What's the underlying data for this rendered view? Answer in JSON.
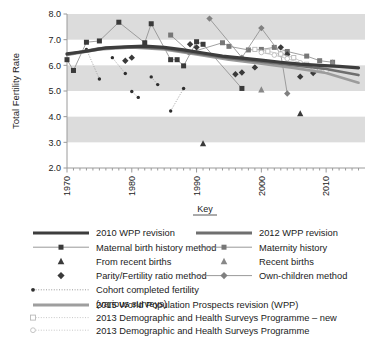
{
  "chart_data": {
    "type": "scatter",
    "title": "",
    "xlabel": "",
    "ylabel": "Total Fertility Rate",
    "xlim": [
      1970,
      2016
    ],
    "ylim": [
      2.0,
      8.0
    ],
    "xticks": [
      1970,
      1980,
      1990,
      2000,
      2010
    ],
    "xtick_labels": [
      "1970",
      "1980",
      "1990",
      "2000",
      "2010"
    ],
    "yticks": [
      2.0,
      3.0,
      4.0,
      5.0,
      6.0,
      7.0,
      8.0
    ],
    "ytick_labels": [
      "2.0",
      "3.0",
      "4.0",
      "5.0",
      "6.0",
      "7.0",
      "8.0"
    ],
    "grid": false,
    "banding": "alternating horizontal grey bands at 3.0-4.0, 5.0-6.0, 7.0-8.0",
    "legend_position": "below plot",
    "series": [
      {
        "name": "2010 WPP revision",
        "style": "thick-line-dark",
        "x": [
          1970,
          1973,
          1976,
          1979,
          1982,
          1985,
          1988,
          1991,
          1994,
          1997,
          2000,
          2003,
          2006,
          2009,
          2012,
          2015
        ],
        "values": [
          6.45,
          6.55,
          6.68,
          6.72,
          6.75,
          6.7,
          6.6,
          6.48,
          6.36,
          6.28,
          6.2,
          6.12,
          6.05,
          6.0,
          5.96,
          5.9
        ]
      },
      {
        "name": "2012 WPP revision",
        "style": "thick-line-mid",
        "x": [
          1970,
          1975,
          1980,
          1985,
          1990,
          1995,
          2000,
          2005,
          2010,
          2015
        ],
        "values": [
          6.42,
          6.66,
          6.72,
          6.66,
          6.46,
          6.28,
          6.14,
          6.0,
          5.86,
          5.62
        ]
      },
      {
        "name": "2015 World Population Prospects revision (WPP)",
        "style": "thick-line-light",
        "x": [
          1970,
          1975,
          1980,
          1985,
          1990,
          1995,
          2000,
          2005,
          2010,
          2015
        ],
        "values": [
          6.4,
          6.62,
          6.7,
          6.62,
          6.42,
          6.22,
          6.06,
          5.9,
          5.7,
          5.32
        ]
      },
      {
        "name": "Maternal birth history method",
        "style": "thin-line-filled-square",
        "x": [
          1970,
          1971,
          1973,
          1975,
          1978,
          1982,
          1983,
          1986,
          1987,
          1988,
          1990,
          1991,
          1997
        ],
        "values": [
          6.22,
          5.8,
          6.9,
          6.95,
          7.68,
          6.88,
          7.62,
          6.22,
          6.22,
          5.98,
          6.92,
          6.82,
          5.1
        ]
      },
      {
        "name": "Maternity history",
        "style": "thin-line-mid-square",
        "x": [
          1986,
          1989,
          1994,
          1995,
          1998,
          2000,
          2002,
          2004,
          2007,
          2009,
          2011
        ],
        "values": [
          7.18,
          6.5,
          6.88,
          6.74,
          6.6,
          6.62,
          6.7,
          6.54,
          6.36,
          6.18,
          6.12
        ]
      },
      {
        "name": "From recent births",
        "style": "filled-triangle",
        "x": [
          1991,
          2006
        ],
        "values": [
          2.95,
          4.12
        ]
      },
      {
        "name": "Recent births",
        "style": "mid-triangle",
        "x": [
          2000,
          2011
        ],
        "values": [
          5.05,
          6.1
        ]
      },
      {
        "name": "Parity/Fertility ratio method",
        "style": "filled-diamond",
        "x": [
          1979,
          1980,
          1989,
          1990,
          1996,
          1997,
          1999,
          2003,
          2004,
          2006,
          2008
        ],
        "values": [
          6.18,
          6.3,
          6.82,
          6.7,
          5.65,
          5.72,
          5.92,
          6.7,
          6.42,
          5.56,
          5.7
        ]
      },
      {
        "name": "Own-children method",
        "style": "mid-diamond-line",
        "x": [
          1992,
          1997,
          2000,
          2003,
          2004
        ],
        "values": [
          7.82,
          6.3,
          7.45,
          6.44,
          4.9
        ]
      },
      {
        "name": "Cohort completed fertility (various surveys)",
        "style": "dotted-small-dot",
        "x": [
          1973,
          1975,
          1977,
          1979,
          1980,
          1981,
          1983,
          1984,
          1986,
          1988
        ],
        "values": [
          6.62,
          5.47,
          6.3,
          5.68,
          4.98,
          4.75,
          5.55,
          5.25,
          4.22,
          5.1
        ]
      },
      {
        "name": "2013 Demographic and Health Surveys Programme – new",
        "style": "open-square-dotted",
        "x": [
          1999,
          2001,
          2003,
          2005,
          2007,
          2009
        ],
        "values": [
          6.62,
          6.55,
          6.44,
          6.3,
          6.04,
          5.88
        ]
      },
      {
        "name": "2013 Demographic and Health Surveys Programme",
        "style": "open-circle-dotted",
        "x": [
          2000,
          2002,
          2004,
          2006,
          2008,
          2010
        ],
        "values": [
          6.5,
          6.4,
          6.26,
          6.1,
          5.92,
          5.8
        ]
      }
    ]
  },
  "axes": {
    "y_title": "Total Fertility Rate",
    "y_labels": [
      "8.0",
      "7.0",
      "6.0",
      "5.0",
      "4.0",
      "3.0",
      "2.0"
    ],
    "x_labels": [
      "1970",
      "1980",
      "1990",
      "2000",
      "2010"
    ]
  },
  "key": {
    "title": "Key",
    "left_column": [
      {
        "label": "2010 WPP revision",
        "marker": "thick-line-dark-icon"
      },
      {
        "label": "Maternal birth history method",
        "marker": "line-filled-square-icon"
      },
      {
        "label": "From recent births",
        "marker": "filled-triangle-icon"
      },
      {
        "label": "Parity/Fertility ratio method",
        "marker": "filled-diamond-icon"
      },
      {
        "label": "Cohort completed fertility",
        "marker": "dotted-dot-icon"
      },
      {
        "label": "(various surveys)",
        "marker": "none"
      }
    ],
    "right_column": [
      {
        "label": "2012 WPP revision",
        "marker": "thick-line-mid-icon"
      },
      {
        "label": "Maternity history",
        "marker": "line-mid-square-icon"
      },
      {
        "label": "Recent births",
        "marker": "mid-triangle-icon"
      },
      {
        "label": "Own-children method",
        "marker": "line-mid-diamond-icon"
      }
    ],
    "bottom_rows": [
      {
        "label": "2015 World Population Prospects revision (WPP)",
        "marker": "thick-line-light-icon"
      },
      {
        "label": "2013 Demographic and Health Surveys Programme – new",
        "marker": "open-square-dotted-icon"
      },
      {
        "label": "2013 Demographic and Health Surveys Programme",
        "marker": "open-circle-dotted-icon"
      }
    ]
  }
}
